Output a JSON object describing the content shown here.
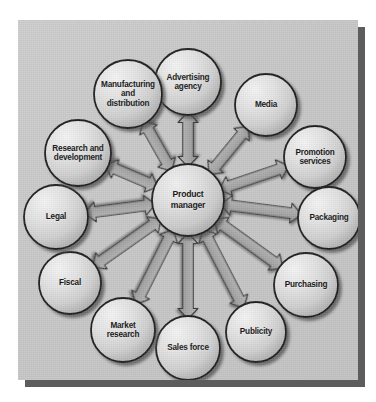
{
  "diagram": {
    "panel": {
      "background_color": "#c6c6c6",
      "shadow_color": "#5d5d5d"
    },
    "hub": {
      "id": "product-manager",
      "label": "Product\nmanager",
      "cx": 170,
      "cy": 180,
      "r": 36
    },
    "node_radius": 33,
    "ring_radius": 110,
    "nodes": [
      {
        "id": "advertising-agency",
        "label": "Advertising\nagency",
        "cx": 170,
        "cy": 62,
        "r": 33,
        "angle_deg": 270
      },
      {
        "id": "media",
        "label": "Media",
        "cx": 248,
        "cy": 85,
        "r": 31,
        "angle_deg": 305
      },
      {
        "id": "promotion-services",
        "label": "Promotion\nservices",
        "cx": 297,
        "cy": 137,
        "r": 31,
        "angle_deg": 335
      },
      {
        "id": "packaging",
        "label": "Packaging",
        "cx": 311,
        "cy": 198,
        "r": 31,
        "angle_deg": 5
      },
      {
        "id": "purchasing",
        "label": "Purchasing",
        "cx": 288,
        "cy": 265,
        "r": 32,
        "angle_deg": 38
      },
      {
        "id": "publicity",
        "label": "Publicity",
        "cx": 238,
        "cy": 312,
        "r": 30,
        "angle_deg": 68
      },
      {
        "id": "sales-force",
        "label": "Sales force",
        "cx": 170,
        "cy": 328,
        "r": 32,
        "angle_deg": 90
      },
      {
        "id": "market-research",
        "label": "Market\nresearch",
        "cx": 105,
        "cy": 310,
        "r": 32,
        "angle_deg": 115
      },
      {
        "id": "fiscal",
        "label": "Fiscal",
        "cx": 52,
        "cy": 263,
        "r": 31,
        "angle_deg": 145
      },
      {
        "id": "legal",
        "label": "Legal",
        "cx": 38,
        "cy": 197,
        "r": 32,
        "angle_deg": 180
      },
      {
        "id": "research-and-development",
        "label": "Research and\ndevelopment",
        "cx": 60,
        "cy": 133,
        "r": 33,
        "angle_deg": 212
      },
      {
        "id": "manufacturing-and-distribution",
        "label": "Manufacturing\nand\ndistribution",
        "cx": 110,
        "cy": 74,
        "r": 34,
        "angle_deg": 243
      }
    ],
    "connector": {
      "style": "double-headed-arrow",
      "count": 12,
      "description": "Each surrounding node is linked to the central hub by a two-way block arrow."
    }
  }
}
